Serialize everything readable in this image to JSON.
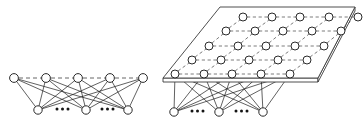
{
  "figure": {
    "title": "",
    "background_color": "#ffffff",
    "node_fill": "#ffffff",
    "node_stroke": "#2a2a2a",
    "solid_edge_color": "#1c1c1c",
    "dashed_edge_color": "#555555",
    "plane_stroke": "#3a3a3a",
    "ellipsis_text": "...",
    "panels": [
      {
        "name": "left-panel-1d-chain",
        "description": "single row of hidden units with dashed lateral chain over a row of visible units",
        "upper_layer": {
          "name": "upper-row",
          "node_radius": 4.4,
          "count": 5,
          "nodes": [
            {
              "id": "u0",
              "x": 14,
              "y": 78
            },
            {
              "id": "u1",
              "x": 46,
              "y": 78
            },
            {
              "id": "u2",
              "x": 78,
              "y": 78
            },
            {
              "id": "u3",
              "x": 110,
              "y": 78
            },
            {
              "id": "u4",
              "x": 143,
              "y": 78
            }
          ],
          "lateral_dashed_links": [
            [
              0,
              1
            ],
            [
              1,
              2
            ],
            [
              2,
              3
            ],
            [
              3,
              4
            ]
          ]
        },
        "lower_layer": {
          "name": "lower-row",
          "node_radius": 4.2,
          "count": 3,
          "nodes": [
            {
              "id": "v0",
              "x": 38,
              "y": 110
            },
            {
              "id": "v1",
              "x": 86,
              "y": 110
            },
            {
              "id": "v2",
              "x": 128,
              "y": 110
            }
          ]
        },
        "ellipses": [
          {
            "x": 62,
            "y": 109
          },
          {
            "x": 107,
            "y": 109
          }
        ],
        "fully_connected": true
      },
      {
        "name": "right-panel-2d-grid",
        "description": "2D grid of hidden units on a tilted plane over a row of visible units",
        "plane": {
          "name": "tilted-plane",
          "top_face": [
            [
              220,
              7
            ],
            [
              355,
              7
            ],
            [
              318,
              78
            ],
            [
              163,
              78
            ]
          ],
          "thickness": 4
        },
        "grid": {
          "name": "grid-layer",
          "rows": 5,
          "cols": 5,
          "node_radius": 4.0,
          "row_origin": [
            {
              "x": 175,
              "y": 74
            },
            {
              "x": 192,
              "y": 60
            },
            {
              "x": 209,
              "y": 46
            },
            {
              "x": 226,
              "y": 31
            },
            {
              "x": 243,
              "y": 17
            }
          ],
          "col_step_x": 28.8,
          "col_step_y": 0
        },
        "lower_layer": {
          "name": "lower-row",
          "node_radius": 4.2,
          "count": 3,
          "nodes": [
            {
              "id": "w0",
              "x": 174,
              "y": 112
            },
            {
              "id": "w1",
              "x": 219,
              "y": 112
            },
            {
              "id": "w2",
              "x": 263,
              "y": 112
            }
          ]
        },
        "ellipses": [
          {
            "x": 197,
            "y": 111
          },
          {
            "x": 241,
            "y": 111
          }
        ],
        "fully_connected": true
      }
    ]
  }
}
